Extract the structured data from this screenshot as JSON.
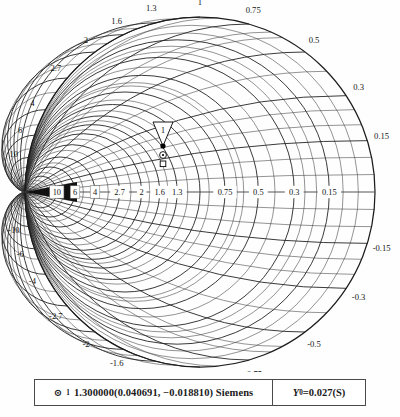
{
  "chart_data": {
    "type": "smith-chart",
    "normalization": "Y0=0.027(S)",
    "resistance_values": [
      0.15,
      0.3,
      0.5,
      0.75,
      1,
      1.3,
      1.6,
      2,
      2.7,
      4,
      6,
      10
    ],
    "reactance_values": [
      0.15,
      0.3,
      0.5,
      0.75,
      1,
      1.3,
      1.6,
      2,
      2.7,
      4,
      6,
      10
    ],
    "axis_tick_labels_left": [
      "10",
      "6",
      "4",
      "2.7",
      "2",
      "1.6",
      "1.3"
    ],
    "axis_tick_labels_right": [
      "0.75",
      "0.5",
      "0.3",
      "0.15"
    ],
    "upper_rim_labels": [
      "-1.3",
      "-1.6",
      "-2",
      "-2.7",
      "-4",
      "-6",
      "-10",
      "-1",
      "-0.75",
      "-0.5",
      "-0.3",
      "-0.15"
    ],
    "lower_rim_labels": [
      "1.3",
      "1.6",
      "2",
      "2.7",
      "4",
      "6",
      "10",
      "1",
      "0.75",
      "0.5",
      "0.3",
      "0.15"
    ],
    "markers": [
      {
        "id": "1",
        "label": "1",
        "frequency": "1.300000",
        "real": 0.040691,
        "imag": -0.01881,
        "unit": "Siemens"
      }
    ],
    "grid": true,
    "center": [
      200,
      192
    ],
    "radius": 175
  },
  "chart": {
    "center_x": 200,
    "center_y": 192,
    "radius": 175,
    "rim_labels_upper": [
      {
        "text": "-1.3",
        "value": -1.3
      },
      {
        "text": "-1.6",
        "value": -1.6
      },
      {
        "text": "-2",
        "value": -2
      },
      {
        "text": "-2.7",
        "value": -2.7
      },
      {
        "text": "-4",
        "value": -4
      },
      {
        "text": "-6",
        "value": -6
      },
      {
        "text": "-10",
        "value": -10
      },
      {
        "text": "-1",
        "value": -1
      },
      {
        "text": "-0.75",
        "value": -0.75
      },
      {
        "text": "-0.5",
        "value": -0.5
      },
      {
        "text": "-0.3",
        "value": -0.3
      },
      {
        "text": "-0.15",
        "value": -0.15
      }
    ],
    "rim_labels_lower": [
      {
        "text": "1.3",
        "value": 1.3
      },
      {
        "text": "1.6",
        "value": 1.6
      },
      {
        "text": "2",
        "value": 2
      },
      {
        "text": "2.7",
        "value": 2.7
      },
      {
        "text": "4",
        "value": 4
      },
      {
        "text": "6",
        "value": 6
      },
      {
        "text": "10",
        "value": 10
      },
      {
        "text": "1",
        "value": 1
      },
      {
        "text": "0.75",
        "value": 0.75
      },
      {
        "text": "0.5",
        "value": 0.5
      },
      {
        "text": "0.3",
        "value": 0.3
      },
      {
        "text": "0.15",
        "value": 0.15
      }
    ],
    "axis_labels_boxed": [
      {
        "text": "10",
        "value": 10
      },
      {
        "text": "6",
        "value": 6
      },
      {
        "text": "4",
        "value": 4
      }
    ],
    "axis_labels_plain": [
      {
        "text": "2.7",
        "value": 2.7
      },
      {
        "text": "2",
        "value": 2
      },
      {
        "text": "1.6",
        "value": 1.6
      },
      {
        "text": "1.3",
        "value": 1.3
      },
      {
        "text": "0.75",
        "value": 0.75
      },
      {
        "text": "0.5",
        "value": 0.5
      },
      {
        "text": "0.3",
        "value": 0.3
      },
      {
        "text": "0.15",
        "value": 0.15
      }
    ],
    "marker": {
      "flag_label": "1",
      "x": 163,
      "y": 146
    }
  },
  "legend": {
    "marker_glyph": "⊙",
    "marker_index": "1",
    "value_text": "1.300000(0.040691, −0.018810) Siemens",
    "normalization_symbol": "Y",
    "normalization_sub": "0",
    "normalization_value": "=0.027(S)"
  }
}
